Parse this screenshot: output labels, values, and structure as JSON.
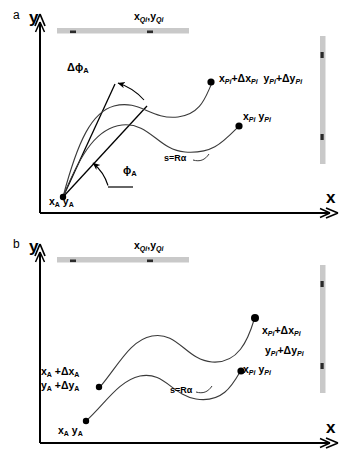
{
  "figure": {
    "panels": [
      {
        "letter": "a",
        "axis_x_label": "x",
        "axis_y_label": "y",
        "labels": {
          "obstacle_top": "x<sub>Qi</sub>,y<sub>Qi</sub>",
          "obstacle_top_plain": "xQi,yQi",
          "start_pose": "x<sub>A</sub> y<sub>A</sub>",
          "start_pose_plain": "xA yA",
          "heading_angle": "ϕA",
          "heading_deviation": "ΔϕA",
          "arc_length": "s=Rα",
          "target_nominal": "x<sub>Pi</sub> y<sub>Pi</sub>",
          "target_nominal_plain": "xPi yPi",
          "target_perturbed": "x<sub>Pi</sub>+Δx<sub>Pi</sub>  y<sub>Pi</sub>+Δy<sub>Pi</sub>",
          "target_perturbed_plain": "xPi+ΔxPi yPi+ΔyPi"
        }
      },
      {
        "letter": "b",
        "axis_x_label": "x",
        "axis_y_label": "y",
        "labels": {
          "obstacle_top": "x<sub>Qi</sub>,y<sub>Qi</sub>",
          "obstacle_top_plain": "xQi,yQi",
          "start_pose": "x<sub>A</sub> y<sub>A</sub>",
          "start_pose_plain": "xA yA",
          "start_pose_perturbed_line1": "x<sub>A</sub>+Δx<sub>A</sub>",
          "start_pose_perturbed_line2": "y<sub>A</sub>+Δy<sub>A</sub>",
          "arc_length": "s=Rα",
          "target_nominal": "x<sub>Pi</sub> y<sub>Pi</sub>",
          "target_nominal_plain": "xPi yPi",
          "target_perturbed_line1": "x<sub>Pi</sub>+Δx<sub>Pi</sub>",
          "target_perturbed_line2": "y<sub>Pi</sub>+Δy<sub>Pi</sub>"
        }
      }
    ],
    "symbols": {
      "delta": "Δ",
      "phi": "ϕ",
      "alpha": "α",
      "comma": ",",
      "plus": "+"
    },
    "colors": {
      "stroke": "#000000",
      "obstacle_bar": "#c9c9c9",
      "obstacle_tick": "#2b2b2b",
      "curve": "#3a3a3a",
      "background": "#ffffff"
    },
    "caption_faint": ""
  }
}
